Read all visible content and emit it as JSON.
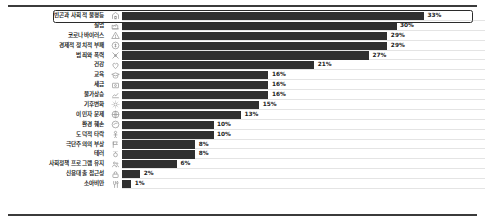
{
  "chart_data": {
    "type": "bar",
    "orientation": "horizontal",
    "title": "",
    "subtitle": "",
    "xlabel": "",
    "ylabel": "",
    "xlim": [
      0,
      35
    ],
    "grid": false,
    "legend": null,
    "value_suffix": "%",
    "highlighted_category": "빈곤과 사회적 불평등",
    "bar_color": "#2f2f2f",
    "icon_color": "#8d8d8d",
    "label_color": "#1d1d1d",
    "rule_color": "#3b3b3b",
    "categories": [
      "빈곤과 사회적 불평등",
      "실업",
      "코로나바이러스",
      "경제적 정치적 부패",
      "범죄와 폭력",
      "건강",
      "교육",
      "세금",
      "물가상승",
      "기후변화",
      "이민자 문제",
      "환경 훼손",
      "도덕적 타락",
      "극단주의의 부상",
      "테러",
      "사회정책 프로그램 유지",
      "신용대출 접근성",
      "소아비만"
    ],
    "values": [
      33,
      30,
      29,
      29,
      27,
      21,
      16,
      16,
      16,
      15,
      13,
      10,
      10,
      8,
      8,
      6,
      2,
      1
    ],
    "value_labels": [
      "33%",
      "30%",
      "29%",
      "29%",
      "27%",
      "21%",
      "16%",
      "16%",
      "16%",
      "15%",
      "13%",
      "10%",
      "10%",
      "8%",
      "8%",
      "6%",
      "2%",
      "1%"
    ],
    "icons": [
      "house-icon",
      "factory-icon",
      "virus-warning-icon",
      "corruption-icon",
      "crime-violence-icon",
      "heart-health-icon",
      "graduation-cap-icon",
      "tax-money-icon",
      "price-chart-icon",
      "climate-sun-icon",
      "immigration-globe-icon",
      "environment-globe-icon",
      "morality-person-icon",
      "extremism-flag-icon",
      "terrorism-icon",
      "social-policy-icon",
      "credit-lock-icon",
      "obesity-food-icon"
    ]
  }
}
